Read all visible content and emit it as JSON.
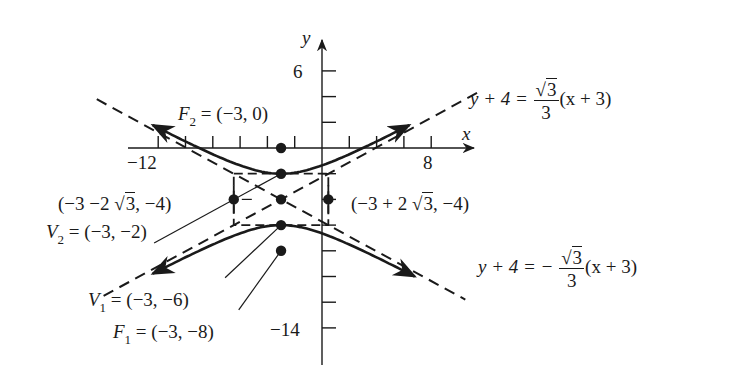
{
  "chart_data": {
    "type": "line",
    "title": "",
    "xlabel": "x",
    "ylabel": "y",
    "xlim": [
      -12,
      8
    ],
    "ylim": [
      -14,
      6
    ],
    "x_tick_step": 2,
    "y_tick_step": 2,
    "x_tick_labels": [
      "-12",
      "8"
    ],
    "y_tick_labels": [
      "6",
      "-14"
    ],
    "grid": false,
    "center": [
      -3,
      -4
    ],
    "a": 2,
    "b": 3.4641,
    "points": [
      {
        "name": "F2",
        "x": -3,
        "y": 0,
        "label": "F₂ = (−3, 0)"
      },
      {
        "name": "V2",
        "x": -3,
        "y": -2,
        "label": "V₂ = (−3, −2)"
      },
      {
        "name": "center",
        "x": -3,
        "y": -4,
        "label": ""
      },
      {
        "name": "V1",
        "x": -3,
        "y": -6,
        "label": "V₁ = (−3, −6)"
      },
      {
        "name": "F1",
        "x": -3,
        "y": -8,
        "label": "F₁ = (−3, −8)"
      },
      {
        "name": "left-conjugate",
        "x": -6.464,
        "y": -4,
        "label": "(−3 −2 √3, −4)"
      },
      {
        "name": "right-conjugate",
        "x": 0.464,
        "y": -4,
        "label": "(−3 + 2 √3, −4)"
      }
    ],
    "series": [
      {
        "name": "upper branch",
        "style": "solid",
        "equation": "y = -4 + 2*sqrt(1 + (x+3)^2/12)"
      },
      {
        "name": "lower branch",
        "style": "solid",
        "equation": "y = -4 - 2*sqrt(1 + (x+3)^2/12)"
      },
      {
        "name": "asymptote +",
        "style": "dashed",
        "label": "y + 4 = √3/3 (x + 3)"
      },
      {
        "name": "asymptote -",
        "style": "dashed",
        "label": "y + 4 = − √3/3 (x + 3)"
      }
    ]
  },
  "labels": {
    "y_axis": "y",
    "x_axis": "x",
    "tick_6": "6",
    "tick_m12": "−12",
    "tick_8": "8",
    "tick_m14": "−14",
    "f2": {
      "name": "F",
      "sub": "2",
      "value": " = (−3, 0)"
    },
    "v2": {
      "name": "V",
      "sub": "2",
      "value": " = (−3, −2)"
    },
    "v1": {
      "name": "V",
      "sub": "1",
      "value": " = (−3, −6)"
    },
    "f1": {
      "name": "F",
      "sub": "1",
      "value": " = (−3, −8)"
    },
    "left_pt": {
      "pre": "(−3 −2 ",
      "rad": "3",
      "post": ", −4)"
    },
    "right_pt": {
      "pre": "(−3 + 2 ",
      "rad": "3",
      "post": ", −4)"
    },
    "asym_pos": {
      "lhs": "y + 4 = ",
      "num_rad": "3",
      "den": "3",
      "rhs": "(x + 3)"
    },
    "asym_neg": {
      "lhs": "y + 4 = − ",
      "num_rad": "3",
      "den": "3",
      "rhs": "(x + 3)"
    },
    "sqrt_sign": "√"
  }
}
